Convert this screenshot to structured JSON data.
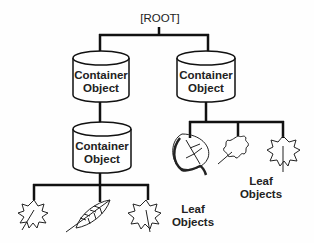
{
  "diagram": {
    "root": {
      "label": "[ROOT]"
    },
    "containers": [
      {
        "id": "left",
        "line1": "Container",
        "line2": "Object"
      },
      {
        "id": "right",
        "line1": "Container",
        "line2": "Object"
      },
      {
        "id": "lower",
        "line1": "Container",
        "line2": "Object"
      }
    ],
    "leaf_groups": [
      {
        "parent": "right",
        "line1": "Leaf",
        "line2": "Objects",
        "leaves": [
          "aspen-leaf-icon",
          "oak-leaf-icon",
          "maple-leaf-icon"
        ]
      },
      {
        "parent": "lower",
        "line1": "Leaf",
        "line2": "Objects",
        "leaves": [
          "maple-leaf-icon",
          "elm-leaf-icon",
          "maple-leaf-icon"
        ]
      }
    ],
    "colors": {
      "line": "#111111",
      "fill": "#ffffff",
      "text": "#222222"
    }
  }
}
